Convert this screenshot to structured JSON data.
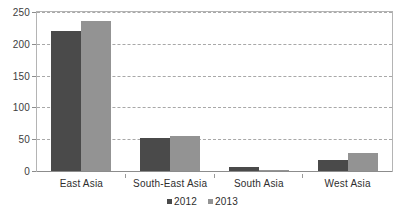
{
  "chart_data": {
    "type": "bar",
    "title": "",
    "subtitle": "",
    "xlabel": "",
    "ylabel": "",
    "categories": [
      "East Asia",
      "South-East Asia",
      "South Asia",
      "West Asia"
    ],
    "series": [
      {
        "name": "2012",
        "color": "#4a4a4a",
        "values": [
          220,
          52,
          7,
          17
        ]
      },
      {
        "name": "2013",
        "color": "#939393",
        "values": [
          236,
          55,
          1,
          29
        ]
      }
    ],
    "ylim": [
      0,
      250
    ],
    "yticks": [
      0,
      50,
      100,
      150,
      200,
      250
    ],
    "ytick_labels": [
      "0",
      "50",
      "100",
      "150",
      "200",
      "250"
    ],
    "grid": true,
    "grid_style": "dashed",
    "grid_color": "#a8a8a8",
    "legend_position": "bottom-center",
    "legend_entries": [
      "2012",
      "2013"
    ],
    "plot_border_color": "#b4b4b4",
    "background": "#ffffff"
  }
}
